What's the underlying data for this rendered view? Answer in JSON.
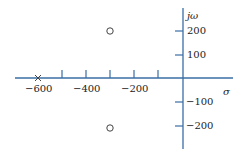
{
  "diagram": {
    "type": "pole-zero plot (s-plane)",
    "axis_color": "#3a6ea5",
    "marker_color": "#444444",
    "axes": {
      "horizontal_label": "σ",
      "vertical_label": "jω"
    },
    "horizontal_ticks": [
      {
        "value": -500,
        "label": ""
      },
      {
        "value": -400,
        "label": "−400"
      },
      {
        "value": -300,
        "label": ""
      },
      {
        "value": -200,
        "label": "−200"
      },
      {
        "value": -100,
        "label": ""
      }
    ],
    "horizontal_extra_label": {
      "value": -600,
      "label": "−600"
    },
    "vertical_ticks": [
      {
        "value": 200,
        "label": "200"
      },
      {
        "value": 100,
        "label": "100"
      },
      {
        "value": -100,
        "label": "−100"
      },
      {
        "value": -200,
        "label": "−200"
      }
    ],
    "poles": [
      {
        "sigma": -600,
        "omega": 0,
        "symbol": "×"
      }
    ],
    "zeros": [
      {
        "sigma": -300,
        "omega": 200,
        "symbol": "○"
      },
      {
        "sigma": -300,
        "omega": -200,
        "symbol": "○"
      }
    ]
  }
}
